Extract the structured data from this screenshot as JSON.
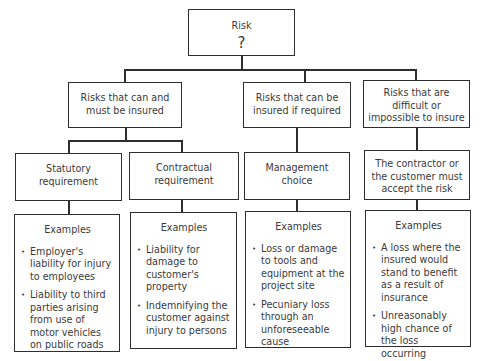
{
  "root": {
    "title": "Risk",
    "symbol": "?"
  },
  "categories": [
    {
      "label": "Risks that can and must be insured"
    },
    {
      "label": "Risks that can be insured if required"
    },
    {
      "label": "Risks that are difficult or impossible to insure"
    }
  ],
  "subcategories": [
    {
      "label": "Statutory requirement",
      "examples_title": "Examples",
      "examples": [
        "Employer's liability for injury to employees",
        "Liability to third parties arising from use of motor vehicles on public roads"
      ]
    },
    {
      "label": "Contractual requirement",
      "examples_title": "Examples",
      "examples": [
        "Liability for damage to customer's property",
        "Indemnifying the customer against injury to persons"
      ]
    },
    {
      "label": "Management choice",
      "examples_title": "Examples",
      "examples": [
        "Loss or damage to tools and equipment at the project site",
        "Pecuniary loss through an unforeseeable cause"
      ]
    },
    {
      "label": "The contractor or the customer must accept the risk",
      "examples_title": "Examples",
      "examples": [
        "A loss where the insured would stand to benefit as a result of insurance",
        "Unreasonably high chance of the loss occurring"
      ]
    }
  ]
}
